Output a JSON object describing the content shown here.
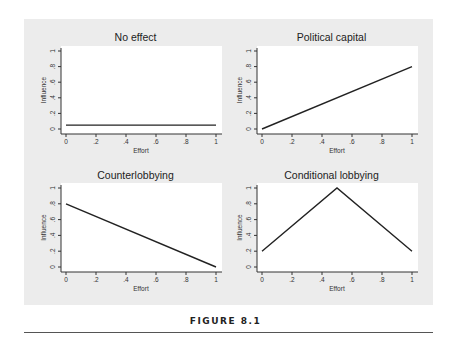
{
  "figure": {
    "caption": "FIGURE 8.1",
    "background": "#ececec",
    "plot_background": "#ffffff",
    "line_color": "#222222"
  },
  "chart_data": [
    {
      "type": "line",
      "title": "No effect",
      "xlabel": "Effort",
      "ylabel": "Influence",
      "xlim": [
        0,
        1
      ],
      "ylim": [
        0,
        1
      ],
      "xticks": [
        "0",
        ".2",
        ".4",
        ".6",
        ".8",
        "1"
      ],
      "yticks": [
        "0",
        ".2",
        ".4",
        ".6",
        ".8",
        "1"
      ],
      "x": [
        0,
        1
      ],
      "y": [
        0.05,
        0.05
      ]
    },
    {
      "type": "line",
      "title": "Political capital",
      "xlabel": "Effort",
      "ylabel": "Influence",
      "xlim": [
        0,
        1
      ],
      "ylim": [
        0,
        1
      ],
      "xticks": [
        "0",
        ".2",
        ".4",
        ".6",
        ".8",
        "1"
      ],
      "yticks": [
        "0",
        ".2",
        ".4",
        ".6",
        ".8",
        "1"
      ],
      "x": [
        0,
        1
      ],
      "y": [
        0,
        0.8
      ]
    },
    {
      "type": "line",
      "title": "Counterlobbying",
      "xlabel": "Effort",
      "ylabel": "Influence",
      "xlim": [
        0,
        1
      ],
      "ylim": [
        0,
        1
      ],
      "xticks": [
        "0",
        ".2",
        ".4",
        ".6",
        ".8",
        "1"
      ],
      "yticks": [
        "0",
        ".2",
        ".4",
        ".6",
        ".8",
        "1"
      ],
      "x": [
        0,
        1
      ],
      "y": [
        0.8,
        0
      ]
    },
    {
      "type": "line",
      "title": "Conditional lobbying",
      "xlabel": "Effort",
      "ylabel": "Influence",
      "xlim": [
        0,
        1
      ],
      "ylim": [
        0,
        1
      ],
      "xticks": [
        "0",
        ".2",
        ".4",
        ".6",
        ".8",
        "1"
      ],
      "yticks": [
        "0",
        ".2",
        ".4",
        ".6",
        ".8",
        "1"
      ],
      "x": [
        0,
        0.5,
        1
      ],
      "y": [
        0.2,
        1,
        0.2
      ]
    }
  ]
}
